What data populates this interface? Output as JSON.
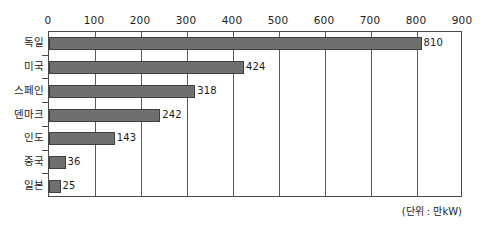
{
  "chart_data": {
    "type": "bar",
    "orientation": "horizontal",
    "title": "",
    "subtitle": "",
    "xlabel": "",
    "ylabel": "",
    "unit_note": "(단위 : 만kW)",
    "categories": [
      "독일",
      "미국",
      "스페인",
      "덴마크",
      "인도",
      "중국",
      "일본"
    ],
    "values": [
      810,
      424,
      318,
      242,
      143,
      36,
      25
    ],
    "value_labels": [
      "810",
      "424",
      "318",
      "242",
      "143",
      "36",
      "25"
    ],
    "xlim": [
      0,
      900
    ],
    "xticks": [
      0,
      100,
      200,
      300,
      400,
      500,
      600,
      700,
      800,
      900
    ],
    "xtick_labels": [
      "0",
      "100",
      "200",
      "300",
      "400",
      "500",
      "600",
      "700",
      "800",
      "900"
    ],
    "grid": true,
    "grid_axis": "x",
    "legend": null,
    "bar_color": "#6f6f6f",
    "bar_edge_color": "#3f3f3f",
    "axis_color": "#4a4a4a",
    "background_color": "#ffffff",
    "text_color": "#1d1d1d"
  }
}
